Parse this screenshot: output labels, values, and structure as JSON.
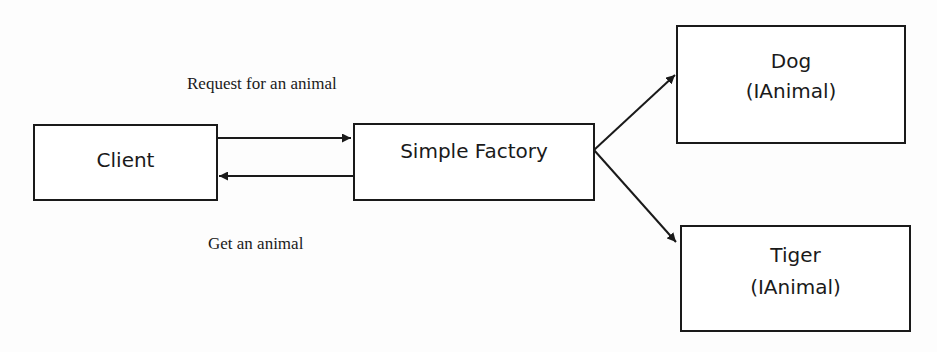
{
  "diagram": {
    "type": "flow",
    "nodes": [
      {
        "id": "client",
        "label": "Client"
      },
      {
        "id": "factory",
        "label": "Simple Factory"
      },
      {
        "id": "dog",
        "label": "Dog",
        "sublabel": "(IAnimal)"
      },
      {
        "id": "tiger",
        "label": "Tiger",
        "sublabel": "(IAnimal)"
      }
    ],
    "edges": [
      {
        "from": "client",
        "to": "factory",
        "label": "Request for an animal"
      },
      {
        "from": "factory",
        "to": "client",
        "label": "Get an animal"
      },
      {
        "from": "factory",
        "to": "dog",
        "label": ""
      },
      {
        "from": "factory",
        "to": "tiger",
        "label": ""
      }
    ]
  },
  "colors": {
    "stroke": "#1a1a1a",
    "background": "#fdfdfd"
  }
}
